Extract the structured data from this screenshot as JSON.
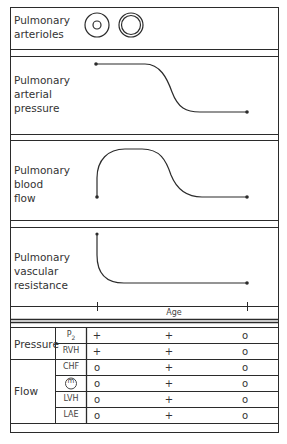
{
  "panels": [
    {
      "id": "arterioles",
      "label_lines": [
        "Pulmonary",
        "arterioles"
      ]
    },
    {
      "id": "pressure",
      "label_lines": [
        "Pulmonary",
        "arterial",
        "pressure"
      ]
    },
    {
      "id": "flow",
      "label_lines": [
        "Pulmonary",
        "blood",
        "flow"
      ]
    },
    {
      "id": "resistance",
      "label_lines": [
        "Pulmonary",
        "vascular",
        "resistance"
      ]
    }
  ],
  "axis": {
    "label": "Age"
  },
  "table": {
    "groups": [
      {
        "label": "Pressure",
        "rows": [
          {
            "sub": "P",
            "sub_suffix": "2",
            "values": [
              "+",
              "+",
              "o"
            ]
          },
          {
            "sub": "RVH",
            "values": [
              "+",
              "+",
              "o"
            ]
          }
        ]
      },
      {
        "label": "Flow",
        "rows": [
          {
            "sub": "CHF",
            "values": [
              "o",
              "+",
              "o"
            ]
          },
          {
            "sub": "m",
            "sub_icon": "circled-m",
            "values": [
              "o",
              "+",
              "o"
            ]
          },
          {
            "sub": "LVH",
            "values": [
              "o",
              "+",
              "o"
            ]
          },
          {
            "sub": "LAE",
            "values": [
              "o",
              "+",
              "o"
            ]
          }
        ]
      }
    ]
  },
  "colors": {
    "line": "#2b2b2b",
    "background": "#ffffff"
  }
}
